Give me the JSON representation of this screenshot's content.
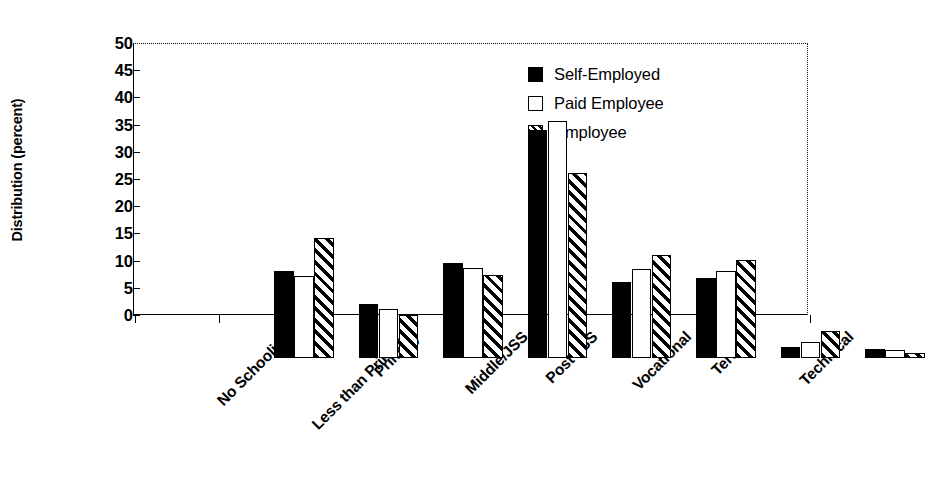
{
  "chart_data": {
    "type": "bar",
    "title": "",
    "xlabel": "",
    "ylabel": "Distribution (percent)",
    "ylim": [
      0,
      50
    ],
    "yticks": [
      0,
      5,
      10,
      15,
      20,
      25,
      30,
      35,
      40,
      45,
      50
    ],
    "ytick_labels": [
      "0",
      "5",
      "10",
      "15",
      "20",
      "25",
      "30",
      "35",
      "40",
      "45",
      "50"
    ],
    "grid": false,
    "top_dotted_border": true,
    "legend_position": "upper right",
    "categories": [
      "No Schooling",
      "Less than Primary",
      "Primary",
      "Middle/JSS",
      "Post JSS",
      "Vocational",
      "Tertiary",
      "Technical"
    ],
    "series": [
      {
        "name": "Self-Employed",
        "fill": "solid",
        "color": "#000000",
        "values": [
          16.0,
          10.0,
          17.5,
          42.0,
          14.0,
          14.8,
          2.0,
          1.6
        ]
      },
      {
        "name": "Paid Employee",
        "fill": "open",
        "color": "#ffffff",
        "values": [
          15.1,
          9.0,
          16.6,
          43.5,
          16.3,
          16.0,
          3.0,
          1.5
        ]
      },
      {
        "name": "Employee",
        "fill": "hatch",
        "color": "#ffffff",
        "values": [
          22.1,
          7.9,
          15.2,
          34.0,
          19.0,
          18.0,
          5.0,
          1.0
        ]
      }
    ]
  },
  "legend": {
    "items": [
      {
        "label": "Self-Employed",
        "fill": "solid"
      },
      {
        "label": "Paid Employee",
        "fill": "open"
      },
      {
        "label": "Employee",
        "fill": "hatch"
      }
    ]
  }
}
